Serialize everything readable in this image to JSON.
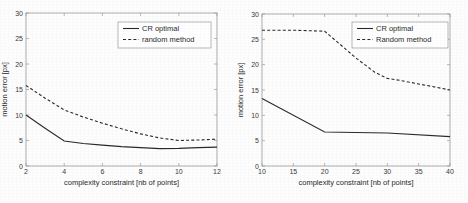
{
  "figure": {
    "panel_count": 2,
    "background_color": "#fdfdfd",
    "line_color": "#2a2a2a",
    "frame_color": "#9a9a9a"
  },
  "chart_data": [
    {
      "id": "left-chart",
      "type": "line",
      "title": "",
      "xlabel": "complexity constraint [nb of points]",
      "ylabel": "motion error [px]",
      "xlim": [
        2,
        12
      ],
      "ylim": [
        0,
        30
      ],
      "xticks": [
        2,
        4,
        6,
        8,
        10,
        12
      ],
      "yticks": [
        0,
        5,
        10,
        15,
        20,
        25,
        30
      ],
      "xticklabels": [
        "2",
        "4",
        "6",
        "8",
        "10",
        "12"
      ],
      "yticklabels": [
        "0",
        "5",
        "10",
        "15",
        "20",
        "25",
        "30"
      ],
      "grid": false,
      "legend_position": "upper right",
      "series": [
        {
          "name": "CR optimal",
          "style": "solid",
          "x": [
            2,
            3,
            4,
            5,
            6,
            7,
            8,
            9,
            10,
            11,
            12
          ],
          "values": [
            10.0,
            7.4,
            4.9,
            4.4,
            4.1,
            3.8,
            3.6,
            3.4,
            3.45,
            3.6,
            3.7
          ]
        },
        {
          "name": "random method",
          "style": "dashed",
          "x": [
            2,
            3,
            4,
            5,
            6,
            7,
            8,
            9,
            10,
            11,
            12
          ],
          "values": [
            15.8,
            13.3,
            11.0,
            9.6,
            8.4,
            7.3,
            6.3,
            5.5,
            5.0,
            5.1,
            5.25
          ]
        }
      ]
    },
    {
      "id": "right-chart",
      "type": "line",
      "title": "",
      "xlabel": "complexity constraint [nb of points]",
      "ylabel": "motion error [px]",
      "xlim": [
        10,
        40
      ],
      "ylim": [
        0,
        30
      ],
      "xticks": [
        10,
        15,
        20,
        25,
        30,
        35,
        40
      ],
      "yticks": [
        0,
        5,
        10,
        15,
        20,
        25,
        30
      ],
      "xticklabels": [
        "10",
        "15",
        "20",
        "25",
        "30",
        "35",
        "40"
      ],
      "yticklabels": [
        "0",
        "5",
        "10",
        "15",
        "20",
        "25",
        "30"
      ],
      "grid": false,
      "legend_position": "upper right",
      "series": [
        {
          "name": "CR optimal",
          "style": "solid",
          "x": [
            10,
            20,
            30,
            40
          ],
          "values": [
            13.3,
            6.7,
            6.5,
            5.8
          ]
        },
        {
          "name": "Random method",
          "style": "dashed",
          "x": [
            10,
            15,
            20,
            22,
            25,
            28,
            30,
            32,
            35,
            40
          ],
          "values": [
            26.8,
            26.8,
            26.6,
            24.5,
            21.3,
            18.5,
            17.3,
            16.9,
            16.2,
            15.0
          ]
        }
      ]
    }
  ]
}
